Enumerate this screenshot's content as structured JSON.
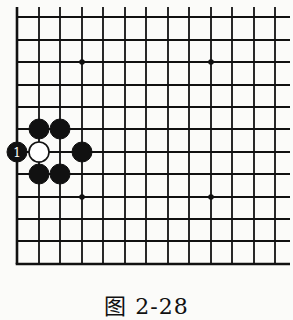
{
  "figure": {
    "caption": "图 2-28"
  },
  "board": {
    "line_color": "#111111",
    "background": "#fbfbf9",
    "vertical_lines_x": [
      17,
      39,
      60,
      82,
      103,
      125,
      146,
      168,
      189,
      211,
      232,
      254,
      275
    ],
    "horizontal_lines_y": [
      17,
      40,
      62,
      85,
      107,
      129,
      152,
      174,
      197,
      219,
      241,
      264
    ],
    "top_extension_y": 7,
    "right_extension_x": 290,
    "left_edge_x": 17,
    "bottom_edge_y": 264,
    "star_points": [
      {
        "x": 82,
        "y": 62
      },
      {
        "x": 211,
        "y": 62
      },
      {
        "x": 82,
        "y": 197
      },
      {
        "x": 211,
        "y": 197
      }
    ],
    "stones": [
      {
        "color": "black",
        "x": 17,
        "y": 152,
        "label": "1"
      },
      {
        "color": "white",
        "x": 39,
        "y": 152,
        "label": ""
      },
      {
        "color": "black",
        "x": 39,
        "y": 129,
        "label": ""
      },
      {
        "color": "black",
        "x": 60,
        "y": 129,
        "label": ""
      },
      {
        "color": "black",
        "x": 82,
        "y": 152,
        "label": ""
      },
      {
        "color": "black",
        "x": 39,
        "y": 174,
        "label": ""
      },
      {
        "color": "black",
        "x": 60,
        "y": 174,
        "label": ""
      }
    ],
    "stone_radius": 10
  }
}
